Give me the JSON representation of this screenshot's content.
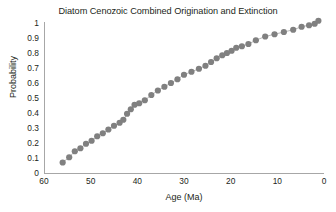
{
  "chart_data": {
    "type": "scatter",
    "title": "Diatom Cenozoic Combined Origination and Extinction",
    "xlabel": "Age (Ma)",
    "ylabel": "Probability",
    "xlim": [
      60,
      0
    ],
    "ylim": [
      0,
      1.05
    ],
    "x_reversed": true,
    "grid": false,
    "legend": null,
    "marker": {
      "shape": "circle",
      "color": "#808080",
      "size": 3.1
    },
    "line": {
      "color": "#9a9a9a",
      "width": 0.7,
      "style": "solid"
    },
    "xticks": [
      60,
      50,
      40,
      30,
      20,
      10,
      0
    ],
    "xtick_labels": [
      "60",
      "50",
      "40",
      "30",
      "20",
      "10",
      "0"
    ],
    "yticks": [
      0,
      0.1,
      0.2,
      0.3,
      0.4,
      0.5,
      0.6,
      0.7,
      0.8,
      0.9,
      1
    ],
    "ytick_labels": [
      "0",
      "0.1",
      "0.2",
      "0.3",
      "0.4",
      "0.5",
      "0.6",
      "0.7",
      "0.8",
      "0.9",
      "1"
    ],
    "x": [
      56.0,
      54.6,
      53.4,
      52.2,
      51.0,
      49.8,
      48.6,
      47.4,
      46.2,
      45.0,
      43.8,
      43.0,
      42.2,
      41.4,
      40.6,
      39.6,
      38.4,
      37.0,
      35.6,
      34.2,
      32.8,
      31.4,
      30.0,
      28.4,
      26.8,
      25.4,
      24.2,
      23.0,
      21.8,
      20.8,
      19.8,
      18.8,
      17.6,
      16.2,
      14.6,
      12.6,
      10.6,
      8.6,
      6.6,
      4.8,
      3.2,
      2.0,
      1.2
    ],
    "y": [
      0.07,
      0.105,
      0.145,
      0.165,
      0.195,
      0.215,
      0.245,
      0.265,
      0.29,
      0.315,
      0.335,
      0.355,
      0.395,
      0.425,
      0.455,
      0.465,
      0.485,
      0.52,
      0.55,
      0.575,
      0.6,
      0.625,
      0.655,
      0.675,
      0.695,
      0.715,
      0.74,
      0.765,
      0.785,
      0.8,
      0.815,
      0.835,
      0.845,
      0.86,
      0.885,
      0.91,
      0.925,
      0.94,
      0.955,
      0.975,
      0.985,
      0.995,
      1.015
    ]
  }
}
